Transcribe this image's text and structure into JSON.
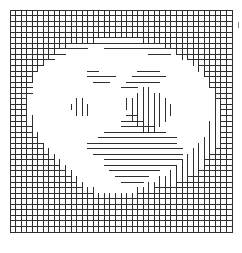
{
  "figure": {
    "background_color": "#ffffff",
    "line_color": "#2e2e2e",
    "tick_color": "#888888"
  },
  "chart_data": {
    "type": "heatmap",
    "subtitle": "",
    "xlabel": "",
    "ylabel": "",
    "grid": true,
    "legend": "none",
    "lattice": {
      "columns": 40,
      "rows": 41,
      "cell_size_px": 5.55,
      "origin_x_px": 10,
      "origin_y_px": 10,
      "width_px": 222,
      "height_px": 232,
      "bond_color": "#2e2e2e",
      "bond_width_px": 1,
      "occupied_fraction_estimate": 0.63
    },
    "annotations": [
      {
        "name": "right-edge-tick",
        "x_px": 238,
        "y_px": 22,
        "length_px": 6
      }
    ],
    "horizontal_bonds": [
      "1111111111111111111111111111111111111111",
      "1111111111111111111111111111111111111111",
      "1111111111111111111111111111111111111111",
      "1111111111111111111111111111111111111111",
      "1111111111111111111111111111111111111111",
      "1111111111111111111111111111111111111111",
      "1111111111111111111111111111111111111111",
      "1111111111111100011111111111111111111111",
      "1111111111000000000000000111101111111111",
      "1111111100000000000000000000000011111111",
      "1111110000000000000000000000000000111111",
      "1111100000000011000000011110000000011111",
      "1111000000000011111000111111000000011111",
      "1111000000000001110001111110000000001111",
      "1111000000000000000011100000000000001111",
      "1111000000000000000000000000000000000111",
      "1110000000000000000000000000000000000111",
      "1110000000000000000000000000000000000011",
      "1110000000000000000000000000000000000011",
      "1110000000000000000001100000000000000011",
      "1110000000000000000011110000000000000011",
      "1111000000000000000011111100000000000011",
      "1111000000000000011111111111000000000011",
      "1111100000000000111111111111110000000011",
      "1111110000000011111111111111110000000011",
      "1111110000000011111111111111111000000111",
      "1111111000000001111111111111111000001111",
      "1111111100000000011111111111111000011111",
      "1111111110000000011111111111110000011111",
      "1111111111000000001111111110000000111111",
      "1111111111100000000111111000000011111111",
      "1111111111110000000011110000001111111111",
      "1111111111111000000000000011111111111111",
      "1111111111111110000000011111111111111111",
      "1111111111111111111111111111111111111111",
      "1111111111111111111111111111111111111111",
      "1111111111111111111111111111111111111111",
      "1111111111111111111111111111111111111111",
      "1111111111111111111111111111111111111111",
      "1111111111111111111111111111111111111111",
      "1111111111111111111111111111111111111111"
    ],
    "vertical_bonds": [
      "11111111111111111111111111111111111111111",
      "11111111111111111111111111111111111111111",
      "11111111111111111111111111111111111111111",
      "11111111111111111111111111111111111111111",
      "11111111111111111111111111111111111111111",
      "11111111111111110000000011111111111111111",
      "11111111111000000000000000001111111111111",
      "11111111100000000000000000000011111111111",
      "11111111000000000000000000000001111111111",
      "11111110000000000000000000000000011111111",
      "11111100000000000000000000000000001111111",
      "11111000000000000000000000000000000111111",
      "11111000000000000000000000000000000011111",
      "11110000000000000000000000000000000011111",
      "11110000000000000000000011000000000001111",
      "11110000000000000000000111110000000001111",
      "11110000000011000000011111111000000001111",
      "11110000000111100000011111111100000001111",
      "11110000000011100000001111111100000001111",
      "11111000000000000000001111111000000001111",
      "11111000000000000000000111110000000011111",
      "11111000000000000000000011100000000011111",
      "11111100000000000000000000000000000011111",
      "11111100000000000000000000000000000111111",
      "11111110000000000000000000000000001111111",
      "11111111000000000000000000000000011111111",
      "11111111100000000000000000000000111111111",
      "11111111110000000000000000000001111111111",
      "11111111111000000000000000000011111111111",
      "11111111111100000000000000000111111111111",
      "11111111111110000000000000011111111111111",
      "11111111111111000000000001111111111111111",
      "11111111111111110000000111111111111111111",
      "11111111111111111111111111111111111111111",
      "11111111111111111111111111111111111111111",
      "11111111111111111111111111111111111111111",
      "11111111111111111111111111111111111111111",
      "11111111111111111111111111111111111111111",
      "11111111111111111111111111111111111111111",
      "11111111111111111111111111111111111111111"
    ]
  }
}
